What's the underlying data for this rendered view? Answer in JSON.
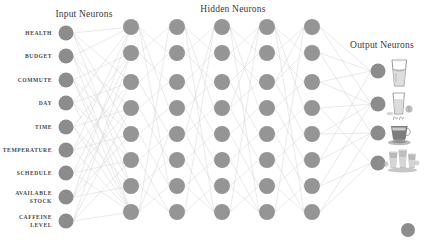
{
  "figure": {
    "type": "neural-network-diagram",
    "background_color": "#ffffff",
    "neuron_color": "#8c8c8c",
    "edge_color": "#cfcfcf",
    "label_color": "#4a4a4a"
  },
  "titles": {
    "input": "Input Neurons",
    "hidden": "Hidden Neurons",
    "output": "Output Neurons"
  },
  "input_layer": {
    "count": 9,
    "labels": [
      "HEALTH",
      "BUDGET",
      "COMMUTE",
      "DAY",
      "TIME",
      "TEMPERATURE",
      "SCHEDULE",
      "AVAILABLE STOCK",
      "CAFFEINE LEVEL"
    ],
    "labels_wrapped": [
      [
        "HEALTH"
      ],
      [
        "BUDGET"
      ],
      [
        "COMMUTE"
      ],
      [
        "DAY"
      ],
      [
        "TIME"
      ],
      [
        "TEMPERATURE"
      ],
      [
        "SCHEDULE"
      ],
      [
        "AVAILABLE",
        "STOCK"
      ],
      [
        "CAFFEINE",
        "LEVEL"
      ]
    ]
  },
  "hidden_layer": {
    "columns": 5,
    "nodes_per_column": 8
  },
  "output_layer": {
    "count": 4,
    "icons": [
      "water-glass-icon",
      "juice-glass-icon",
      "coffee-cup-icon",
      "drinks-tray-icon"
    ]
  },
  "stray_node": {
    "present": true,
    "name": "detached-neuron"
  }
}
